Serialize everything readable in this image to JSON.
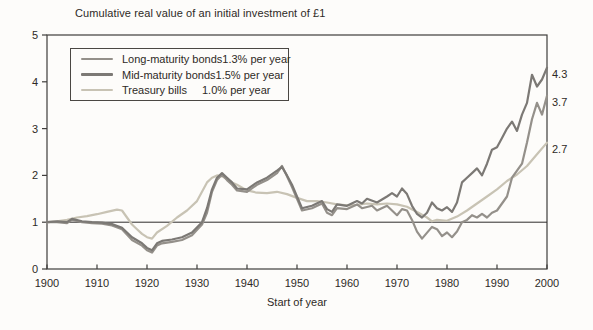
{
  "title": "Cumulative real value of an initial investment of £1",
  "x_axis_label": "Start of year",
  "colors": {
    "background": "#fdfcfa",
    "axis": "#3f3d3b",
    "reference_line": "#2e2c2a",
    "text": "#2e2a26",
    "legend_border": "#4a4743"
  },
  "chart_data": {
    "type": "line",
    "title": "Cumulative real value of an initial investment of £1",
    "xlabel": "Start of year",
    "ylabel": "",
    "xlim": [
      1900,
      2000
    ],
    "ylim": [
      0,
      5
    ],
    "x_ticks": [
      1900,
      1910,
      1920,
      1930,
      1940,
      1950,
      1960,
      1970,
      1980,
      1990,
      2000
    ],
    "y_ticks": [
      0,
      1,
      2,
      3,
      4,
      5
    ],
    "reference_line_y": 1,
    "grid": false,
    "legend_position": "upper-left-inside",
    "series": [
      {
        "name": "Long-maturity bonds",
        "rate_label": "1.3% per year",
        "final_label": "3.7",
        "final_value": 3.7,
        "color": "#94908a",
        "points": [
          [
            1900,
            1.0
          ],
          [
            1902,
            1.0
          ],
          [
            1904,
            0.98
          ],
          [
            1905,
            1.05
          ],
          [
            1907,
            1.0
          ],
          [
            1909,
            0.98
          ],
          [
            1911,
            0.97
          ],
          [
            1913,
            0.93
          ],
          [
            1915,
            0.85
          ],
          [
            1917,
            0.62
          ],
          [
            1919,
            0.5
          ],
          [
            1920,
            0.4
          ],
          [
            1921,
            0.35
          ],
          [
            1922,
            0.5
          ],
          [
            1923,
            0.55
          ],
          [
            1925,
            0.58
          ],
          [
            1927,
            0.62
          ],
          [
            1929,
            0.72
          ],
          [
            1931,
            0.95
          ],
          [
            1932,
            1.2
          ],
          [
            1933,
            1.65
          ],
          [
            1934,
            1.9
          ],
          [
            1935,
            2.02
          ],
          [
            1936,
            1.9
          ],
          [
            1937,
            1.8
          ],
          [
            1938,
            1.68
          ],
          [
            1940,
            1.65
          ],
          [
            1942,
            1.8
          ],
          [
            1944,
            1.9
          ],
          [
            1946,
            2.05
          ],
          [
            1947,
            2.2
          ],
          [
            1948,
            1.98
          ],
          [
            1949,
            1.75
          ],
          [
            1950,
            1.5
          ],
          [
            1951,
            1.25
          ],
          [
            1953,
            1.3
          ],
          [
            1955,
            1.4
          ],
          [
            1956,
            1.2
          ],
          [
            1957,
            1.15
          ],
          [
            1958,
            1.3
          ],
          [
            1960,
            1.28
          ],
          [
            1962,
            1.38
          ],
          [
            1963,
            1.3
          ],
          [
            1965,
            1.35
          ],
          [
            1966,
            1.25
          ],
          [
            1968,
            1.35
          ],
          [
            1970,
            1.15
          ],
          [
            1971,
            1.28
          ],
          [
            1972,
            1.25
          ],
          [
            1973,
            1.05
          ],
          [
            1974,
            0.8
          ],
          [
            1975,
            0.65
          ],
          [
            1977,
            0.9
          ],
          [
            1978,
            0.85
          ],
          [
            1979,
            0.7
          ],
          [
            1980,
            0.78
          ],
          [
            1981,
            0.68
          ],
          [
            1982,
            0.8
          ],
          [
            1983,
            1.0
          ],
          [
            1984,
            1.05
          ],
          [
            1985,
            1.15
          ],
          [
            1986,
            1.1
          ],
          [
            1987,
            1.18
          ],
          [
            1988,
            1.1
          ],
          [
            1989,
            1.2
          ],
          [
            1990,
            1.25
          ],
          [
            1991,
            1.4
          ],
          [
            1992,
            1.55
          ],
          [
            1993,
            1.95
          ],
          [
            1994,
            2.1
          ],
          [
            1995,
            2.25
          ],
          [
            1996,
            2.7
          ],
          [
            1997,
            3.2
          ],
          [
            1998,
            3.55
          ],
          [
            1999,
            3.3
          ],
          [
            2000,
            3.7
          ]
        ]
      },
      {
        "name": "Mid-maturity bonds",
        "rate_label": "1.5% per year",
        "final_label": "4.3",
        "final_value": 4.3,
        "color": "#7c7975",
        "points": [
          [
            1900,
            1.0
          ],
          [
            1902,
            1.02
          ],
          [
            1904,
            1.0
          ],
          [
            1905,
            1.07
          ],
          [
            1907,
            1.02
          ],
          [
            1909,
            1.0
          ],
          [
            1911,
            0.99
          ],
          [
            1913,
            0.96
          ],
          [
            1915,
            0.88
          ],
          [
            1917,
            0.68
          ],
          [
            1919,
            0.55
          ],
          [
            1920,
            0.45
          ],
          [
            1921,
            0.4
          ],
          [
            1922,
            0.55
          ],
          [
            1923,
            0.6
          ],
          [
            1925,
            0.63
          ],
          [
            1927,
            0.68
          ],
          [
            1929,
            0.78
          ],
          [
            1931,
            1.0
          ],
          [
            1932,
            1.3
          ],
          [
            1933,
            1.7
          ],
          [
            1934,
            1.95
          ],
          [
            1935,
            2.05
          ],
          [
            1936,
            1.95
          ],
          [
            1937,
            1.85
          ],
          [
            1938,
            1.72
          ],
          [
            1940,
            1.7
          ],
          [
            1942,
            1.85
          ],
          [
            1944,
            1.95
          ],
          [
            1946,
            2.1
          ],
          [
            1947,
            2.18
          ],
          [
            1948,
            2.0
          ],
          [
            1949,
            1.8
          ],
          [
            1950,
            1.55
          ],
          [
            1951,
            1.3
          ],
          [
            1953,
            1.35
          ],
          [
            1955,
            1.45
          ],
          [
            1956,
            1.28
          ],
          [
            1957,
            1.22
          ],
          [
            1958,
            1.38
          ],
          [
            1960,
            1.35
          ],
          [
            1962,
            1.45
          ],
          [
            1963,
            1.4
          ],
          [
            1964,
            1.5
          ],
          [
            1966,
            1.42
          ],
          [
            1968,
            1.55
          ],
          [
            1969,
            1.62
          ],
          [
            1970,
            1.55
          ],
          [
            1971,
            1.72
          ],
          [
            1972,
            1.6
          ],
          [
            1973,
            1.35
          ],
          [
            1974,
            1.18
          ],
          [
            1975,
            1.1
          ],
          [
            1976,
            1.2
          ],
          [
            1977,
            1.42
          ],
          [
            1978,
            1.3
          ],
          [
            1979,
            1.25
          ],
          [
            1980,
            1.32
          ],
          [
            1981,
            1.22
          ],
          [
            1982,
            1.42
          ],
          [
            1983,
            1.85
          ],
          [
            1984,
            1.95
          ],
          [
            1985,
            2.05
          ],
          [
            1986,
            2.15
          ],
          [
            1987,
            2.0
          ],
          [
            1988,
            2.25
          ],
          [
            1989,
            2.55
          ],
          [
            1990,
            2.6
          ],
          [
            1991,
            2.8
          ],
          [
            1992,
            3.0
          ],
          [
            1993,
            3.15
          ],
          [
            1994,
            2.95
          ],
          [
            1995,
            3.3
          ],
          [
            1996,
            3.55
          ],
          [
            1997,
            4.15
          ],
          [
            1998,
            3.9
          ],
          [
            1999,
            4.05
          ],
          [
            2000,
            4.3
          ]
        ]
      },
      {
        "name": "Treasury bills",
        "rate_label": "1.0% per year",
        "final_label": "2.7",
        "final_value": 2.7,
        "color": "#c8c3b4",
        "points": [
          [
            1900,
            1.0
          ],
          [
            1902,
            1.02
          ],
          [
            1904,
            1.05
          ],
          [
            1906,
            1.1
          ],
          [
            1908,
            1.13
          ],
          [
            1910,
            1.17
          ],
          [
            1912,
            1.22
          ],
          [
            1914,
            1.27
          ],
          [
            1915,
            1.25
          ],
          [
            1916,
            1.1
          ],
          [
            1917,
            0.95
          ],
          [
            1918,
            0.85
          ],
          [
            1919,
            0.75
          ],
          [
            1920,
            0.68
          ],
          [
            1921,
            0.65
          ],
          [
            1922,
            0.78
          ],
          [
            1924,
            0.92
          ],
          [
            1926,
            1.1
          ],
          [
            1928,
            1.25
          ],
          [
            1930,
            1.45
          ],
          [
            1931,
            1.65
          ],
          [
            1932,
            1.85
          ],
          [
            1933,
            1.95
          ],
          [
            1934,
            2.0
          ],
          [
            1935,
            1.98
          ],
          [
            1936,
            1.92
          ],
          [
            1937,
            1.85
          ],
          [
            1938,
            1.8
          ],
          [
            1940,
            1.68
          ],
          [
            1942,
            1.63
          ],
          [
            1944,
            1.62
          ],
          [
            1946,
            1.65
          ],
          [
            1948,
            1.6
          ],
          [
            1950,
            1.52
          ],
          [
            1952,
            1.45
          ],
          [
            1954,
            1.45
          ],
          [
            1956,
            1.42
          ],
          [
            1958,
            1.38
          ],
          [
            1960,
            1.36
          ],
          [
            1962,
            1.37
          ],
          [
            1964,
            1.4
          ],
          [
            1966,
            1.38
          ],
          [
            1968,
            1.4
          ],
          [
            1970,
            1.38
          ],
          [
            1972,
            1.33
          ],
          [
            1974,
            1.22
          ],
          [
            1976,
            1.1
          ],
          [
            1977,
            1.02
          ],
          [
            1978,
            1.05
          ],
          [
            1980,
            1.03
          ],
          [
            1982,
            1.12
          ],
          [
            1984,
            1.25
          ],
          [
            1986,
            1.4
          ],
          [
            1988,
            1.55
          ],
          [
            1990,
            1.7
          ],
          [
            1992,
            1.88
          ],
          [
            1994,
            2.02
          ],
          [
            1996,
            2.2
          ],
          [
            1998,
            2.45
          ],
          [
            2000,
            2.7
          ]
        ]
      }
    ]
  }
}
